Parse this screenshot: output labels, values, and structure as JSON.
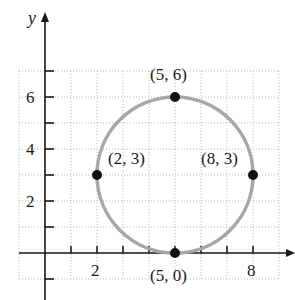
{
  "chart_data": {
    "type": "scatter",
    "title": "",
    "xlabel": "",
    "ylabel": "y",
    "xlim": [
      -1,
      9
    ],
    "ylim": [
      -1,
      7
    ],
    "grid": true,
    "x_tick_labels": [
      "2",
      "8"
    ],
    "y_tick_labels": [
      "2",
      "4",
      "6"
    ],
    "circle": {
      "center": [
        5,
        3
      ],
      "radius": 3,
      "color": "#a6a6a6"
    },
    "points": [
      {
        "x": 5,
        "y": 6,
        "label": "(5, 6)"
      },
      {
        "x": 2,
        "y": 3,
        "label": "(2, 3)"
      },
      {
        "x": 8,
        "y": 3,
        "label": "(8, 3)"
      },
      {
        "x": 5,
        "y": 0,
        "label": "(5, 0)"
      }
    ]
  },
  "labels": {
    "y_axis": "y",
    "x2": "2",
    "x8": "8",
    "y2": "2",
    "y4": "4",
    "y6": "6",
    "p1": "(5, 6)",
    "p2": "(2, 3)",
    "p3": "(8, 3)",
    "p4": "(5, 0)"
  }
}
